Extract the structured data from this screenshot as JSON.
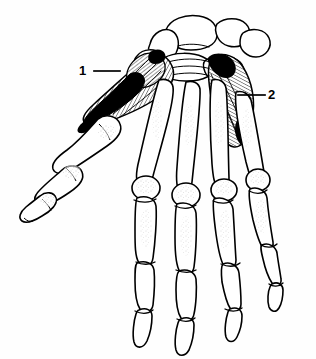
{
  "figure": {
    "background_color": "#fefefe",
    "ink_color": "#000000",
    "view": "palmar view of right hand showing carpal bones, metacarpals, phalanges, thenar and hypothenar muscle groups"
  },
  "labels": [
    {
      "id": "1",
      "text": "1",
      "target": "thenar-muscle-group",
      "leader_from_x": 94,
      "leader_from_y": 71,
      "leader_to_x": 120,
      "leader_to_y": 71
    },
    {
      "id": "2",
      "text": "2",
      "target": "hypothenar-muscle-group",
      "leader_from_x": 265,
      "leader_from_y": 95,
      "leader_to_x": 238,
      "leader_to_y": 95
    }
  ],
  "structures": {
    "carpus": "carpal-bone-cluster",
    "metacarpals": [
      "first-metacarpal",
      "second-metacarpal",
      "third-metacarpal",
      "fourth-metacarpal",
      "fifth-metacarpal"
    ],
    "digits": [
      "thumb",
      "index-finger",
      "middle-finger",
      "ring-finger",
      "little-finger"
    ],
    "muscles": [
      "thenar-eminence",
      "hypothenar-eminence"
    ]
  }
}
